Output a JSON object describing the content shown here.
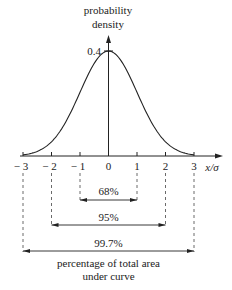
{
  "chart_data": {
    "type": "line",
    "title": "",
    "xlabel": "x/σ",
    "ylabel": "probability density",
    "ylabel_lines": [
      "probability",
      "density"
    ],
    "x_ticks": [
      -3,
      -2,
      -1,
      0,
      1,
      2,
      3
    ],
    "x_tick_labels": [
      "− 3",
      "− 2",
      "− 1",
      "0",
      "1",
      "2",
      "3"
    ],
    "y_ticks": [
      0.4
    ],
    "y_tick_labels": [
      "0.4"
    ],
    "xlim": [
      -3,
      3
    ],
    "ylim": [
      0,
      0.4
    ],
    "grid": false,
    "series": [
      {
        "name": "normal distribution",
        "x": [
          -3,
          -2.5,
          -2,
          -1.5,
          -1,
          -0.5,
          0,
          0.5,
          1,
          1.5,
          2,
          2.5,
          3
        ],
        "values": [
          0.004,
          0.018,
          0.054,
          0.13,
          0.242,
          0.352,
          0.399,
          0.352,
          0.242,
          0.13,
          0.054,
          0.018,
          0.004
        ]
      }
    ],
    "annotations": [
      {
        "label": "68%",
        "from": -1,
        "to": 1
      },
      {
        "label": "95%",
        "from": -2,
        "to": 2
      },
      {
        "label": "99.7%",
        "from": -3,
        "to": 3
      }
    ],
    "caption_lines": [
      "percentage of total area",
      "under curve"
    ]
  },
  "colors": {
    "line": "#222222",
    "background": "#ffffff"
  }
}
